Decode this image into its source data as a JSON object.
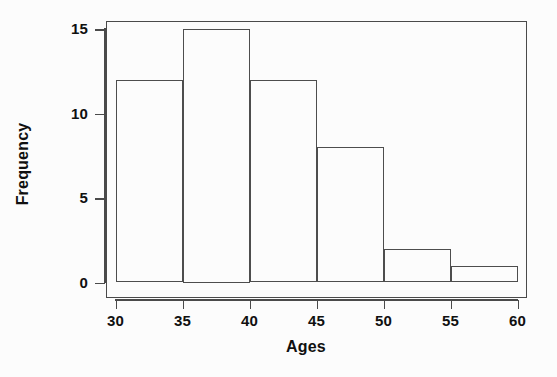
{
  "chart_data": {
    "type": "bar",
    "title": "",
    "subtitle": "",
    "xlabel": "Ages",
    "ylabel": "Frequency",
    "bin_width": 5,
    "bin_edges": [
      30,
      35,
      40,
      45,
      50,
      55,
      60
    ],
    "categories": [
      "30-35",
      "35-40",
      "40-45",
      "45-50",
      "50-55",
      "55-60"
    ],
    "values": [
      12,
      15,
      12,
      8,
      2,
      1
    ],
    "bars": [
      {
        "label": "30-35",
        "start": 30,
        "end": 35,
        "value": 12
      },
      {
        "label": "35-40",
        "start": 35,
        "end": 40,
        "value": 15
      },
      {
        "label": "40-45",
        "start": 40,
        "end": 45,
        "value": 12
      },
      {
        "label": "45-50",
        "start": 45,
        "end": 50,
        "value": 8
      },
      {
        "label": "50-55",
        "start": 50,
        "end": 55,
        "value": 2
      },
      {
        "label": "55-60",
        "start": 55,
        "end": 60,
        "value": 1
      }
    ],
    "xlim": [
      30,
      60
    ],
    "ylim": [
      0,
      16.4
    ],
    "xticks": [
      30,
      35,
      40,
      45,
      50,
      55,
      60
    ],
    "yticks": [
      0,
      5,
      10,
      15
    ],
    "xtick_labels": [
      "30",
      "35",
      "40",
      "45",
      "50",
      "55",
      "60"
    ],
    "ytick_labels": [
      "0",
      "5",
      "10",
      "15"
    ],
    "grid": false,
    "legend": null,
    "legend_position": "none",
    "colors": {
      "background": "#fcfcfc",
      "bar_fill": "transparent",
      "bar_outline": "#4d4d4d",
      "axis": "#4a4a4a",
      "text": "#101010"
    }
  }
}
